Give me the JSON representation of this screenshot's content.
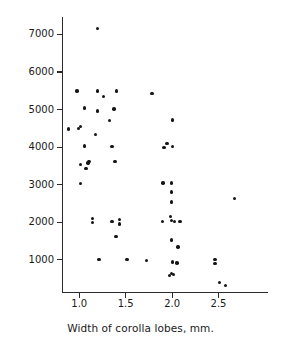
{
  "chart_data": {
    "type": "scatter",
    "title": "",
    "xlabel": "Width of corolla lobes, mm.",
    "ylabel": "Elevation, ft.",
    "xlim": [
      0.82,
      3.04
    ],
    "ylim": [
      100,
      7450
    ],
    "grid": false,
    "legend": null,
    "xticks": [
      1.0,
      1.5,
      2.0,
      2.5
    ],
    "xtick_labels": [
      "1.0",
      "1.5",
      "2.0",
      "2.5"
    ],
    "yticks": [
      1000,
      2000,
      3000,
      4000,
      5000,
      6000,
      7000
    ],
    "ytick_labels": [
      "1000",
      "2000",
      "3000",
      "4000",
      "5000",
      "6000",
      "7000"
    ],
    "marker": "filled-circle",
    "marker_color": "#151515",
    "points": [
      {
        "x": 1.2,
        "y": 7150
      },
      {
        "x": 0.98,
        "y": 5480
      },
      {
        "x": 1.2,
        "y": 5480
      },
      {
        "x": 1.27,
        "y": 5330
      },
      {
        "x": 1.41,
        "y": 5480
      },
      {
        "x": 1.79,
        "y": 5420
      },
      {
        "x": 1.06,
        "y": 5030
      },
      {
        "x": 1.2,
        "y": 4950
      },
      {
        "x": 1.33,
        "y": 4690
      },
      {
        "x": 1.38,
        "y": 5000
      },
      {
        "x": 2.01,
        "y": 4710
      },
      {
        "x": 0.89,
        "y": 4470
      },
      {
        "x": 1.0,
        "y": 4480
      },
      {
        "x": 1.02,
        "y": 4540
      },
      {
        "x": 1.18,
        "y": 4320
      },
      {
        "x": 1.06,
        "y": 4010
      },
      {
        "x": 1.36,
        "y": 4000
      },
      {
        "x": 1.92,
        "y": 3980
      },
      {
        "x": 1.95,
        "y": 4080
      },
      {
        "x": 2.01,
        "y": 4000
      },
      {
        "x": 1.02,
        "y": 3520
      },
      {
        "x": 1.08,
        "y": 3420
      },
      {
        "x": 1.1,
        "y": 3560
      },
      {
        "x": 1.11,
        "y": 3600
      },
      {
        "x": 1.39,
        "y": 3610
      },
      {
        "x": 1.02,
        "y": 3010
      },
      {
        "x": 1.91,
        "y": 3030
      },
      {
        "x": 2.0,
        "y": 3030
      },
      {
        "x": 2.0,
        "y": 2790
      },
      {
        "x": 2.0,
        "y": 2520
      },
      {
        "x": 2.68,
        "y": 2610
      },
      {
        "x": 1.15,
        "y": 2090
      },
      {
        "x": 1.15,
        "y": 1970
      },
      {
        "x": 1.36,
        "y": 2010
      },
      {
        "x": 1.44,
        "y": 2060
      },
      {
        "x": 1.44,
        "y": 1940
      },
      {
        "x": 1.9,
        "y": 2000
      },
      {
        "x": 1.99,
        "y": 2140
      },
      {
        "x": 2.0,
        "y": 2030
      },
      {
        "x": 2.03,
        "y": 2010
      },
      {
        "x": 2.09,
        "y": 2010
      },
      {
        "x": 1.4,
        "y": 1610
      },
      {
        "x": 2.0,
        "y": 1510
      },
      {
        "x": 2.07,
        "y": 1330
      },
      {
        "x": 1.22,
        "y": 1000
      },
      {
        "x": 1.52,
        "y": 1000
      },
      {
        "x": 1.73,
        "y": 960
      },
      {
        "x": 2.01,
        "y": 930
      },
      {
        "x": 2.06,
        "y": 900
      },
      {
        "x": 2.47,
        "y": 1000
      },
      {
        "x": 2.47,
        "y": 880
      },
      {
        "x": 1.98,
        "y": 560
      },
      {
        "x": 2.0,
        "y": 620
      },
      {
        "x": 2.02,
        "y": 600
      },
      {
        "x": 2.52,
        "y": 380
      },
      {
        "x": 2.58,
        "y": 300
      }
    ]
  }
}
